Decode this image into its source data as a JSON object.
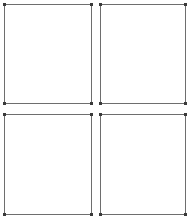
{
  "layout": {
    "type": "grid",
    "rows": 2,
    "columns": 2,
    "border_color": "#6e6e6e",
    "background": "#ffffff"
  },
  "panels": [
    {
      "id": "top-left",
      "x": 4,
      "y": 4,
      "width": 88,
      "height": 100,
      "content": ""
    },
    {
      "id": "top-right",
      "x": 100,
      "y": 4,
      "width": 86,
      "height": 100,
      "content": ""
    },
    {
      "id": "bottom-left",
      "x": 4,
      "y": 114,
      "width": 88,
      "height": 101,
      "content": ""
    },
    {
      "id": "bottom-right",
      "x": 100,
      "y": 114,
      "width": 86,
      "height": 101,
      "content": ""
    }
  ]
}
